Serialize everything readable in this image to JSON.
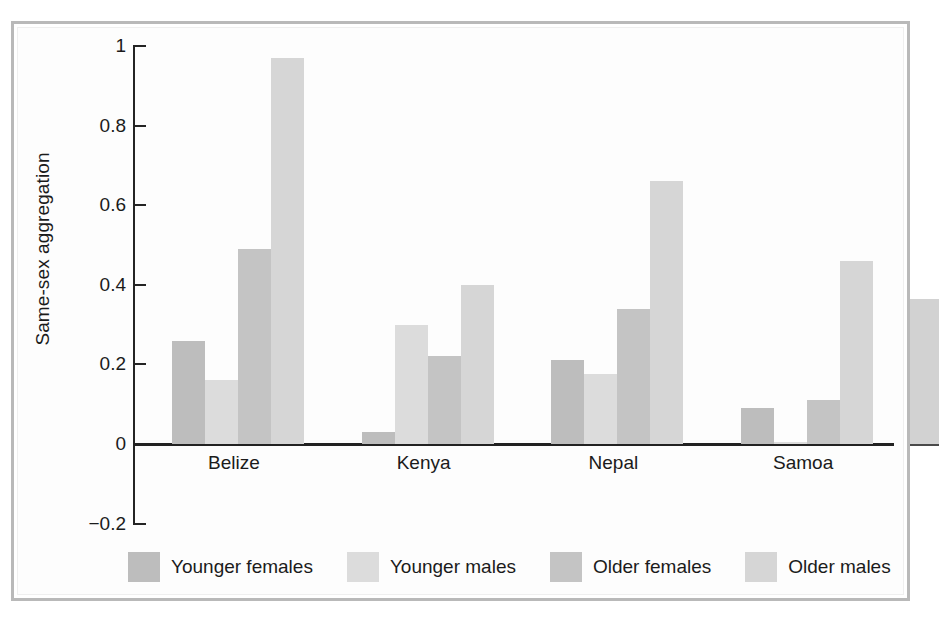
{
  "chart_data": {
    "type": "bar",
    "title": "",
    "xlabel": "",
    "ylabel": "Same-sex aggregation",
    "categories": [
      "Belize",
      "Kenya",
      "Nepal",
      "Samoa"
    ],
    "series": [
      {
        "name": "Younger females",
        "color": "#bdbdbd",
        "values": [
          0.26,
          0.03,
          0.21,
          0.09
        ]
      },
      {
        "name": "Younger males",
        "color": "#dcdcdc",
        "values": [
          0.16,
          0.3,
          0.175,
          0.005
        ]
      },
      {
        "name": "Older females",
        "color": "#c4c4c4",
        "values": [
          0.49,
          0.22,
          0.34,
          0.11
        ]
      },
      {
        "name": "Older males",
        "color": "#d6d6d6",
        "values": [
          0.97,
          0.4,
          0.66,
          0.46
        ]
      }
    ],
    "ylim": [
      -0.2,
      1
    ],
    "yticks": [
      1,
      0.8,
      0.6,
      0.4,
      0.2,
      0,
      -0.2
    ],
    "ytick_labels": [
      "1",
      "0.8",
      "0.6",
      "0.4",
      "0.2",
      "0",
      "−0.2"
    ],
    "grid": false,
    "legend_position": "bottom",
    "axis_color": "#222222",
    "background": "#ffffff"
  },
  "legend": {
    "items": [
      {
        "label": "Younger females"
      },
      {
        "label": "Younger males"
      },
      {
        "label": "Older females"
      },
      {
        "label": "Older males"
      }
    ]
  }
}
